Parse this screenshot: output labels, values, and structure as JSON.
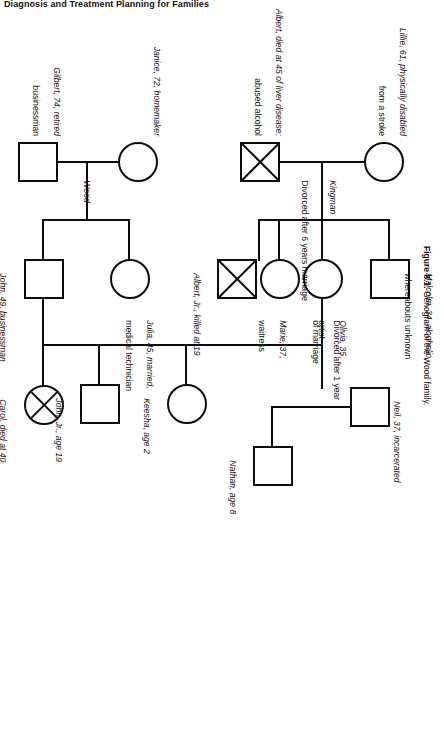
{
  "page": {
    "running_head": "Diagnosis and Treatment Planning for Families",
    "caption_number": "Figure 8.1.",
    "caption_text": "Genogram of the Wood family."
  },
  "figure": {
    "type": "genogram",
    "family_names": [
      {
        "id": "kingman",
        "label": "Kingman"
      },
      {
        "id": "wood",
        "label": "Wood"
      }
    ],
    "relationship_notes": [
      {
        "id": "div-6yr",
        "text": "Divorced after 6 years marriage"
      },
      {
        "id": "div-1yr-line1",
        "text": "Divorced after 1 year"
      },
      {
        "id": "div-1yr-line2",
        "text": "of marriage"
      }
    ],
    "people": [
      {
        "id": "lillie",
        "name": "Lillie",
        "shape": "circle",
        "deceased": false,
        "label_line1": "Lillie, 61, physically disabled",
        "label_line2": "from a stroke"
      },
      {
        "id": "albert",
        "name": "Albert",
        "shape": "square",
        "deceased": true,
        "label_line1": "Albert, died at 45 of liver disease:",
        "label_line2": "abused alcohol"
      },
      {
        "id": "malcolm",
        "name": "Malcolm",
        "shape": "square",
        "deceased": false,
        "label_line1": "Malcolm, 34, alcoholic,",
        "label_line2": "whereabouts unknown"
      },
      {
        "id": "albert-jr",
        "name": "Albert, Jr.",
        "shape": "square",
        "deceased": true,
        "label_line1": "Albert, Jr., killed at 19",
        "label_line2": ""
      },
      {
        "id": "olivia",
        "name": "Olivia",
        "shape": "circle",
        "deceased": false,
        "label_line1": "Olivia, 35,",
        "label_line2": "artist"
      },
      {
        "id": "marie",
        "name": "Marie",
        "shape": "circle",
        "deceased": false,
        "label_line1": "Marie, 37,",
        "label_line2": "waitress"
      },
      {
        "id": "neil",
        "name": "Neil",
        "shape": "square",
        "deceased": false,
        "label_line1": "Neil, 37, incarcerated",
        "label_line2": ""
      },
      {
        "id": "nathan",
        "name": "Nathan",
        "shape": "square",
        "deceased": false,
        "label_line1": "Nathan, age 8",
        "label_line2": ""
      },
      {
        "id": "keesha",
        "name": "Keesha",
        "shape": "circle",
        "deceased": false,
        "label_line1": "Keesha, age 2",
        "label_line2": ""
      },
      {
        "id": "gilbert",
        "name": "Gilbert",
        "shape": "square",
        "deceased": false,
        "label_line1": "Gilbert, 74, retired",
        "label_line2": "businessman"
      },
      {
        "id": "janice",
        "name": "Janice",
        "shape": "circle",
        "deceased": false,
        "label_line1": "Janice, 72, homemaker",
        "label_line2": ""
      },
      {
        "id": "julia",
        "name": "Julia",
        "shape": "circle",
        "deceased": false,
        "label_line1": "Julia, 45, married,",
        "label_line2": "medical technician"
      },
      {
        "id": "john",
        "name": "John",
        "shape": "square",
        "deceased": false,
        "label_line1": "John, 49, businessman",
        "label_line2": ""
      },
      {
        "id": "carol",
        "name": "Carol",
        "shape": "circle",
        "deceased": true,
        "label_line1": "Carol, died at 40",
        "label_line2": ""
      },
      {
        "id": "john-jr",
        "name": "John, Jr.",
        "shape": "square",
        "deceased": false,
        "label_line1": "John, Jr., age 19",
        "label_line2": ""
      }
    ]
  },
  "colors": {
    "ink": "#0d0d0d",
    "paper": "#ffffff"
  }
}
